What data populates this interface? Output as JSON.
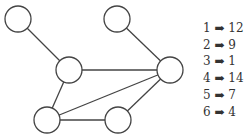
{
  "graph": {
    "nodes": [
      {
        "id": "a",
        "x": 18,
        "y": 19
      },
      {
        "id": "b",
        "x": 117,
        "y": 19
      },
      {
        "id": "c",
        "x": 69,
        "y": 70
      },
      {
        "id": "d",
        "x": 170,
        "y": 70
      },
      {
        "id": "e",
        "x": 47,
        "y": 120
      },
      {
        "id": "f",
        "x": 118,
        "y": 120
      }
    ],
    "edges": [
      [
        "a",
        "c"
      ],
      [
        "b",
        "d"
      ],
      [
        "c",
        "d"
      ],
      [
        "c",
        "e"
      ],
      [
        "e",
        "d"
      ],
      [
        "e",
        "f"
      ],
      [
        "f",
        "d"
      ]
    ],
    "node_radius": 13,
    "stroke_color": "#444444"
  },
  "legend": {
    "arrow": "➡",
    "items": [
      {
        "key": "1",
        "value": "12"
      },
      {
        "key": "2",
        "value": "9"
      },
      {
        "key": "3",
        "value": "1"
      },
      {
        "key": "4",
        "value": "14"
      },
      {
        "key": "5",
        "value": "7"
      },
      {
        "key": "6",
        "value": "4"
      }
    ]
  }
}
